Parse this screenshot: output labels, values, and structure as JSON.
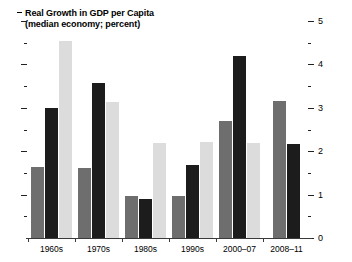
{
  "title": {
    "line1": "Real Growth in GDP per Capita",
    "line2": "(median economy; percent)",
    "bullet_dash": "-"
  },
  "chart_data": {
    "type": "bar",
    "title": "Real Growth in GDP per Capita (median economy; percent)",
    "xlabel": "",
    "ylabel": "",
    "ylim": [
      0,
      5
    ],
    "grid": false,
    "legend": "none",
    "axis_position": "right",
    "y_major_ticks": [
      0,
      1,
      2,
      3,
      4,
      5
    ],
    "y_minor_ticks": [
      0.5,
      1.5,
      2.5,
      3.5,
      4.5
    ],
    "y_tick_labels": [
      "0",
      "1",
      "2",
      "3",
      "4",
      "5"
    ],
    "categories": [
      "1960s",
      "1970s",
      "1980s",
      "1990s",
      "2000–07",
      "2008–11"
    ],
    "series": [
      {
        "name": "series-1",
        "color": "#6e6e6e",
        "values": [
          1.63,
          1.61,
          0.97,
          0.97,
          2.7,
          3.16
        ]
      },
      {
        "name": "series-2",
        "color": "#1c1c1c",
        "values": [
          3.0,
          3.57,
          0.9,
          1.68,
          4.2,
          2.17
        ]
      },
      {
        "name": "series-3",
        "color": "#dcdcdc",
        "values": [
          4.55,
          3.13,
          2.19,
          2.21,
          2.19,
          null
        ]
      }
    ]
  }
}
